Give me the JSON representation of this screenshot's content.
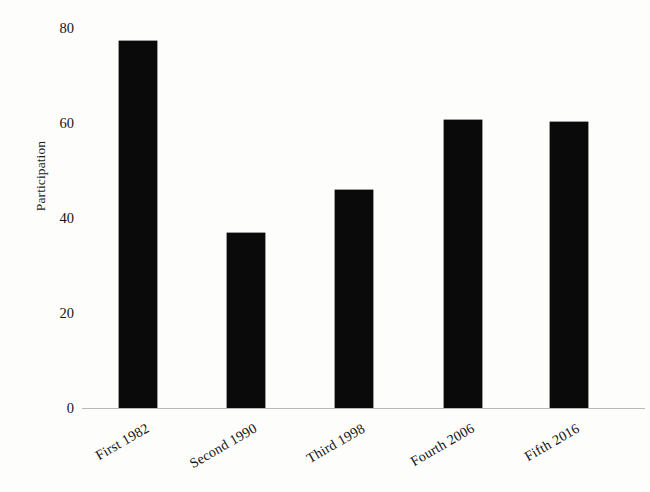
{
  "chart_data": {
    "type": "bar",
    "title": "",
    "subtitle": "",
    "xlabel": "",
    "ylabel": "Participation",
    "categories": [
      "First 1982",
      "Second 1990",
      "Third 1998",
      "Fourth 2006",
      "Fifth 2016"
    ],
    "values": [
      77.3,
      36.8,
      45.9,
      60.6,
      60.2
    ],
    "ylim": [
      0,
      80
    ],
    "yticks": [
      0,
      20,
      40,
      60,
      80
    ],
    "ytick_labels": [
      "0",
      "20",
      "40",
      "60",
      "80"
    ],
    "grid": false,
    "legend": false,
    "legend_position": "none",
    "bar_color": "#0b0a0a",
    "axis_color": "#b9b9b9",
    "background_color": "#fdfdfc",
    "xtick_label_rotation": -30
  },
  "axis": {
    "y_title": "Participation",
    "ticks": [
      {
        "label": "80",
        "value": 80
      },
      {
        "label": "60",
        "value": 60
      },
      {
        "label": "40",
        "value": 40
      },
      {
        "label": "20",
        "value": 20
      },
      {
        "label": "0",
        "value": 0
      }
    ]
  },
  "bars": [
    {
      "label": "First 1982",
      "value": 77.3
    },
    {
      "label": "Second 1990",
      "value": 36.8
    },
    {
      "label": "Third 1998",
      "value": 45.9
    },
    {
      "label": "Fourth 2006",
      "value": 60.6
    },
    {
      "label": "Fifth 2016",
      "value": 60.2
    }
  ]
}
